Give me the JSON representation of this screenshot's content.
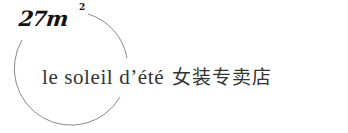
{
  "logo": {
    "brand_mark": "27m",
    "superscript": "2",
    "tagline_latin": "le soleil d’été",
    "tagline_chinese": "女装专卖店",
    "colors": {
      "text": "#333333",
      "mark": "#111111",
      "circle": "#8a8a8a",
      "background": "#ffffff"
    }
  }
}
